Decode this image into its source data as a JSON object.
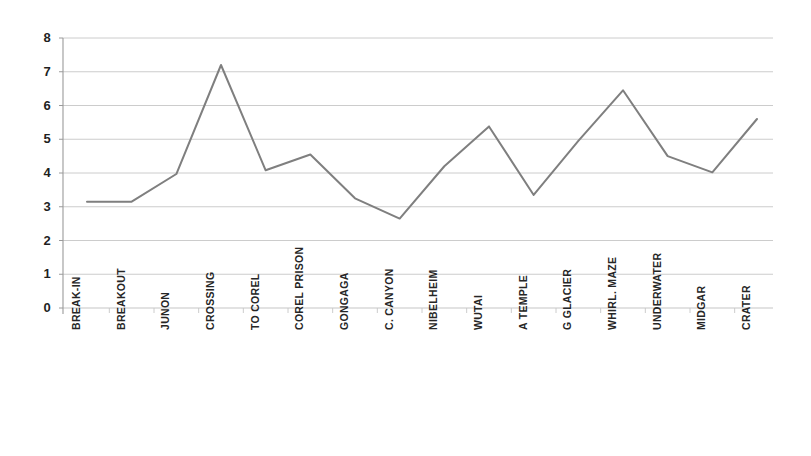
{
  "chart_data": {
    "type": "line",
    "title": "",
    "subtitle": "",
    "xlabel": "",
    "ylabel": "",
    "categories": [
      "BREAK-IN",
      "BREAKOUT",
      "JUNON",
      "CROSSING",
      "TO COREL",
      "COREL PRISON",
      "GONGAGA",
      "C. CANYON",
      "NIBELHEIM",
      "WUTAI",
      "A TEMPLE",
      "G GLACIER",
      "WHIRL. MAZE",
      "UNDERWATER",
      "MIDGAR",
      "CRATER"
    ],
    "values": [
      3.15,
      3.15,
      3.97,
      7.2,
      4.08,
      4.55,
      3.25,
      2.65,
      4.2,
      5.38,
      3.35,
      4.95,
      6.45,
      4.5,
      4.02,
      5.6
    ],
    "ylim": [
      0,
      8
    ],
    "yticks": [
      0,
      1,
      2,
      3,
      4,
      5,
      6,
      7,
      8
    ],
    "ytick_labels": [
      "0",
      "1",
      "2",
      "3",
      "4",
      "5",
      "6",
      "7",
      "8"
    ],
    "grid": true,
    "grid_axis": "y",
    "legend": false,
    "legend_position": "none",
    "series": [
      {
        "name": "series-1",
        "color": "#7f7f7f",
        "values": [
          3.15,
          3.15,
          3.97,
          7.2,
          4.08,
          4.55,
          3.25,
          2.65,
          4.2,
          5.38,
          3.35,
          4.95,
          6.45,
          4.5,
          4.02,
          5.6
        ]
      }
    ],
    "colors": {
      "line": "#7f7f7f",
      "grid": "#c6c6c6",
      "axis": "#9a9a9a",
      "background": "#ffffff",
      "text": "#262626"
    }
  }
}
